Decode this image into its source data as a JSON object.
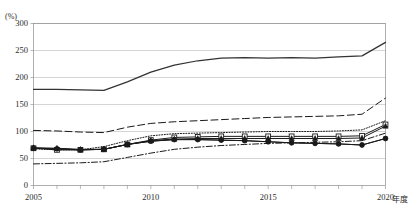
{
  "chart_data": {
    "type": "line",
    "title": "",
    "xlabel": "年度",
    "ylabel": "(%)",
    "ylim": [
      0,
      300
    ],
    "yticks": [
      0,
      50,
      100,
      150,
      200,
      250,
      300
    ],
    "grid": true,
    "legend_position": "none",
    "x": [
      2005,
      2006,
      2007,
      2008,
      2009,
      2010,
      2011,
      2012,
      2013,
      2014,
      2015,
      2016,
      2017,
      2018,
      2019,
      2020
    ],
    "xtick_labels": [
      "2005",
      "2010",
      "2015",
      "2020"
    ],
    "xtick_values": [
      2005,
      2010,
      2015,
      2020
    ],
    "series": [
      {
        "name": "series-solid-thick-top",
        "style": "solid",
        "marker": "none",
        "color": "#333333",
        "values": [
          178,
          178,
          177,
          176,
          192,
          210,
          223,
          231,
          236,
          237,
          236,
          237,
          236,
          238,
          240,
          265
        ]
      },
      {
        "name": "series-dashed",
        "style": "dashed",
        "marker": "none",
        "color": "#1a1a1a",
        "values": [
          102,
          101,
          99,
          98,
          108,
          115,
          118,
          120,
          122,
          124,
          126,
          127,
          128,
          129,
          132,
          162
        ]
      },
      {
        "name": "series-dotted",
        "style": "dotted",
        "marker": "none",
        "color": "#1a1a1a",
        "values": [
          68,
          66,
          66,
          72,
          83,
          92,
          96,
          97,
          98,
          99,
          100,
          100,
          100,
          101,
          103,
          120
        ]
      },
      {
        "name": "series-open-square",
        "style": "solid",
        "marker": "open-square",
        "color": "#1a1a1a",
        "values": [
          69,
          66,
          66,
          67,
          76,
          84,
          89,
          90,
          91,
          91,
          91,
          91,
          91,
          91,
          92,
          113
        ]
      },
      {
        "name": "series-filled-triangle",
        "style": "solid",
        "marker": "filled-triangle",
        "color": "#1a1a1a",
        "values": [
          70,
          69,
          67,
          67,
          76,
          83,
          86,
          87,
          87,
          87,
          87,
          87,
          87,
          87,
          88,
          110
        ]
      },
      {
        "name": "series-filled-circle",
        "style": "solid",
        "marker": "filled-circle",
        "color": "#1a1a1a",
        "values": [
          69,
          68,
          66,
          67,
          76,
          82,
          85,
          85,
          84,
          83,
          81,
          79,
          78,
          77,
          75,
          87
        ]
      },
      {
        "name": "series-filled-circle-low",
        "style": "solid",
        "marker": "filled-circle",
        "color": "#1a1a1a",
        "values": [
          69,
          68,
          66,
          67,
          76,
          82,
          85,
          85,
          84,
          83,
          81,
          79,
          78,
          77,
          75,
          87
        ]
      },
      {
        "name": "series-dash-dot",
        "style": "dash-dot",
        "marker": "none",
        "color": "#1a1a1a",
        "values": [
          40,
          41,
          42,
          44,
          52,
          60,
          67,
          71,
          74,
          76,
          78,
          79,
          80,
          81,
          83,
          97
        ]
      }
    ]
  },
  "axis": {
    "unit_label": "(%)",
    "x_unit_label": "年度"
  }
}
